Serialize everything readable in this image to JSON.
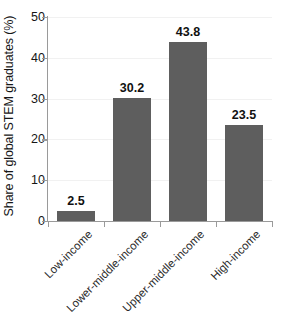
{
  "chart_data": {
    "type": "bar",
    "title": "",
    "subtitle": "",
    "xlabel": "",
    "ylabel": "Share of global STEM graduates (%)",
    "categories": [
      "Low-income",
      "Lower-middle-income",
      "Upper-middle-income",
      "High-income"
    ],
    "values": [
      2.5,
      30.2,
      43.8,
      23.5
    ],
    "value_labels": [
      "2.5",
      "30.2",
      "43.8",
      "23.5"
    ],
    "ylim": [
      0,
      50
    ],
    "yticks": [
      0,
      10,
      20,
      30,
      40,
      50
    ],
    "ytick_labels": [
      "0",
      "10",
      "20",
      "30",
      "40",
      "50"
    ],
    "grid": "horizontal",
    "legend": "none",
    "bar_color": "#5e5e5e",
    "gridline_color": "#f1f1f1",
    "axis_color": "#9a9a9a",
    "background": "#ffffff",
    "xtick_rotation": -45,
    "series": [
      {
        "name": "Share of global STEM graduates",
        "values": [
          2.5,
          30.2,
          43.8,
          23.5
        ]
      }
    ]
  }
}
